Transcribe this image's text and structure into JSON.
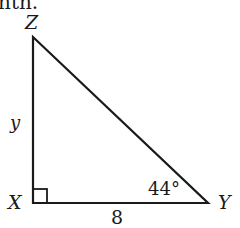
{
  "header_fragment": "nth.",
  "triangle": {
    "vertices": {
      "top": "Z",
      "right_angle": "X",
      "right": "Y"
    },
    "side_vertical_label": "y",
    "side_bottom_label": "8",
    "angle_label": "44°",
    "colors": {
      "stroke": "#1a1a1a",
      "background": "#ffffff"
    }
  }
}
